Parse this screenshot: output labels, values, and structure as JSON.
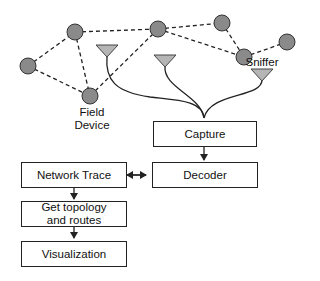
{
  "diagram": {
    "type": "network sniffing pipeline",
    "labels": {
      "field_device": "Field\nDevice",
      "field_device_line1": "Field",
      "field_device_line2": "Device",
      "sniffer": "Sniffer"
    },
    "boxes": {
      "capture": "Capture",
      "decoder": "Decoder",
      "network_trace": "Network Trace",
      "topology_line1": "Get topology",
      "topology_line2": "and routes",
      "visualization": "Visualization"
    },
    "nodes": [
      {
        "id": "n1",
        "x": 75,
        "y": 32
      },
      {
        "id": "n2",
        "x": 158,
        "y": 29
      },
      {
        "id": "n3",
        "x": 222,
        "y": 23
      },
      {
        "id": "n4",
        "x": 244,
        "y": 57
      },
      {
        "id": "n5",
        "x": 287,
        "y": 42
      },
      {
        "id": "n6",
        "x": 28,
        "y": 66
      },
      {
        "id": "n7",
        "x": 90,
        "y": 96
      }
    ],
    "colors": {
      "node_fill": "#8a8a8a",
      "antenna_fill": "#b5b5b5",
      "stroke": "#222222"
    }
  }
}
